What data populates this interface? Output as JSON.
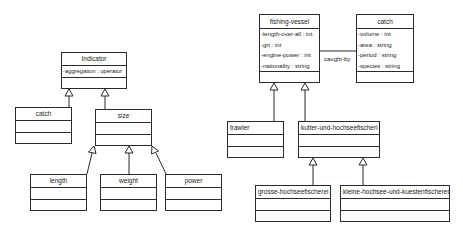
{
  "left_diagram": {
    "classes": {
      "indicator": {
        "name": "Indicator",
        "attributes": [
          "-aggregation : operator"
        ]
      },
      "catch": {
        "name": "catch",
        "attributes": []
      },
      "size": {
        "name": "size",
        "attributes": []
      },
      "length": {
        "name": "length",
        "attributes": []
      },
      "weight": {
        "name": "weight",
        "attributes": []
      },
      "power": {
        "name": "power",
        "attributes": []
      }
    },
    "generalizations": [
      {
        "child": "catch",
        "parent": "Indicator"
      },
      {
        "child": "size",
        "parent": "Indicator"
      },
      {
        "child": "length",
        "parent": "size"
      },
      {
        "child": "weight",
        "parent": "size"
      },
      {
        "child": "power",
        "parent": "size"
      }
    ]
  },
  "right_diagram": {
    "classes": {
      "fishing_vessel": {
        "name": "fishing-vessel",
        "attributes": [
          "-length-over-all : int",
          "-grt : int",
          "-engine-power : int",
          "-nationality : string"
        ]
      },
      "catch": {
        "name": "catch",
        "attributes": [
          "-volume : int",
          "-area : string",
          "-period : string",
          "-species : string"
        ]
      },
      "trawler": {
        "name": "trawler",
        "attributes": []
      },
      "kutter": {
        "name": "kutter-und-hochseefischeri",
        "attributes": []
      },
      "grosse": {
        "name": "grosse-hochseefischerei",
        "attributes": []
      },
      "kleine": {
        "name": "kleine-hochsee-und-kuestenfischerei",
        "attributes": []
      }
    },
    "association": {
      "label": "caught-by",
      "from": "fishing-vessel",
      "to": "catch"
    },
    "generalizations": [
      {
        "child": "trawler",
        "parent": "fishing-vessel"
      },
      {
        "child": "kutter-und-hochseefischeri",
        "parent": "fishing-vessel"
      },
      {
        "child": "grosse-hochseefischerei",
        "parent": "kutter-und-hochseefischeri"
      },
      {
        "child": "kleine-hochsee-und-kuestenfischerei",
        "parent": "kutter-und-hochseefischeri"
      }
    ]
  },
  "colors": {
    "line": "#2a2a2a",
    "background": "#ffffff",
    "text": "#222222"
  }
}
